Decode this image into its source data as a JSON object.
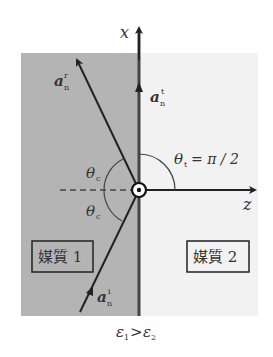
{
  "axes": {
    "x_label": "x",
    "z_label": "z"
  },
  "vectors": {
    "reflected": {
      "base": "a",
      "sub": "n",
      "sup": "r"
    },
    "transmitted": {
      "base": "a",
      "sub": "n",
      "sup": "t"
    },
    "incident": {
      "base": "a",
      "sub": "n",
      "sup": "i"
    }
  },
  "angles": {
    "critical_upper": {
      "sym": "θ",
      "sub": "c"
    },
    "critical_lower": {
      "sym": "θ",
      "sub": "c"
    },
    "transmitted": {
      "sym": "θ",
      "sub": "t",
      "value": "= π / 2"
    }
  },
  "media": {
    "medium1": "媒質 1",
    "medium2": "媒質 2"
  },
  "condition": {
    "left": "ε",
    "left_sub": "1",
    "op": ">",
    "right": "ε",
    "right_sub": "2"
  },
  "colors": {
    "medium1_fill": "#b4b4b4",
    "medium2_fill": "#f2f2f2",
    "line": "#222222"
  }
}
